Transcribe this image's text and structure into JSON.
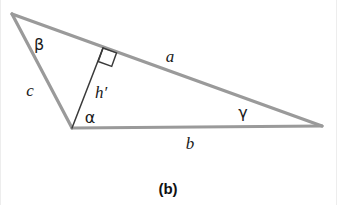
{
  "figure": {
    "caption": "(b)",
    "background_color": "#ffffff",
    "stroke_color": "#9a9a9a",
    "altitude_color": "#3a3a3a",
    "label_color": "#1a1a1a",
    "width": 337,
    "height": 205
  },
  "geometry": {
    "type": "triangle-with-altitude",
    "vertices": {
      "apex_top_left": {
        "x": 12,
        "y": 14
      },
      "vertex_bottom_left": {
        "x": 72,
        "y": 128
      },
      "vertex_right": {
        "x": 322,
        "y": 126
      }
    },
    "altitude": {
      "from": {
        "x": 72,
        "y": 128
      },
      "foot": {
        "x": 103,
        "y": 48
      },
      "perpendicular_to": "a"
    },
    "right_angle_marker": {
      "size": 14,
      "at": {
        "x": 103,
        "y": 48
      }
    }
  },
  "labels": {
    "side_a": {
      "text": "a",
      "x": 170,
      "y": 56
    },
    "side_b": {
      "text": "b",
      "x": 190,
      "y": 143
    },
    "side_c": {
      "text": "c",
      "x": 30,
      "y": 90
    },
    "altitude_h": {
      "text": "h′",
      "x": 101,
      "y": 92
    },
    "angle_alpha": {
      "text": "α",
      "x": 90,
      "y": 118
    },
    "angle_beta": {
      "text": "β",
      "x": 39,
      "y": 45
    },
    "angle_gamma": {
      "text": "γ",
      "x": 243,
      "y": 113
    }
  },
  "caption_position": {
    "x": 168,
    "y": 188
  }
}
